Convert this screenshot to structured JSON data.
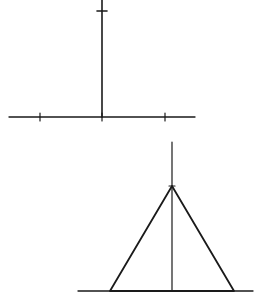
{
  "diagram": {
    "background": "#ffffff",
    "stroke_color": "#1a1a1a",
    "figures": [
      {
        "name": "figure-axis-with-ticks",
        "description": "Vertical line rising from center of a horizontal baseline, with tick marks",
        "baseline": {
          "x1": 9,
          "y1": 117,
          "x2": 195,
          "y2": 117
        },
        "vertical": {
          "x1": 102,
          "y1": 0,
          "x2": 102,
          "y2": 117
        },
        "top_tick": {
          "x1": 97,
          "y1": 11,
          "x2": 107,
          "y2": 11
        },
        "baseline_ticks_x": [
          40,
          102,
          165
        ]
      },
      {
        "name": "figure-triangle-with-altitude",
        "description": "Isosceles triangle on a baseline with a vertical altitude line extending above the apex",
        "baseline": {
          "x1": 78,
          "y1": 291,
          "x2": 253,
          "y2": 291
        },
        "vertical": {
          "x1": 172,
          "y1": 142,
          "x2": 172,
          "y2": 291
        },
        "apex": {
          "x": 172,
          "y": 186
        },
        "base_left": {
          "x": 110,
          "y": 291
        },
        "base_right": {
          "x": 234,
          "y": 291
        }
      }
    ]
  }
}
